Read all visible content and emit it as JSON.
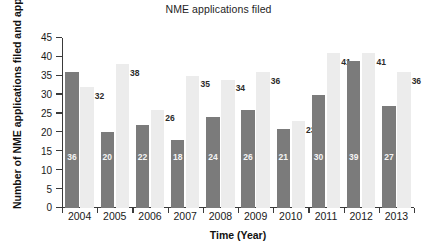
{
  "chart_data": {
    "type": "bar",
    "title": "NME applications filed",
    "xlabel": "Time (Year)",
    "ylabel": "Number of NME applications filed and approvals",
    "categories": [
      "2004",
      "2005",
      "2006",
      "2007",
      "2008",
      "2009",
      "2010",
      "2011",
      "2012",
      "2013"
    ],
    "series": [
      {
        "name": "applications filed",
        "color": "#7b7b7b",
        "values": [
          36,
          20,
          22,
          18,
          24,
          26,
          21,
          30,
          39,
          27
        ]
      },
      {
        "name": "approvals",
        "color": "#ececec",
        "values": [
          32,
          38,
          26,
          35,
          34,
          36,
          23,
          41,
          41,
          36
        ]
      }
    ],
    "ylim": [
      0,
      45
    ],
    "yticks": [
      0,
      5,
      10,
      15,
      20,
      25,
      30,
      35,
      40,
      45
    ],
    "ytick_labels": [
      "0",
      "5",
      "10",
      "15",
      "20",
      "25",
      "30",
      "35",
      "40",
      "45"
    ],
    "grid": false,
    "legend": "none",
    "data_labels": true
  }
}
